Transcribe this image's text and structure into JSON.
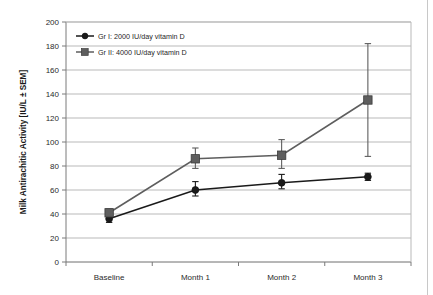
{
  "chart_data": {
    "type": "line",
    "title": "",
    "xlabel": "",
    "ylabel": "Milk Antirachitic Activity [IU/L ± SEM]",
    "categories": [
      "Baseline",
      "Month 1",
      "Month 2",
      "Month 3"
    ],
    "ylim": [
      0,
      200
    ],
    "ytick_step": 20,
    "yticks": [
      200,
      180,
      160,
      140,
      120,
      100,
      80,
      60,
      40,
      20,
      0
    ],
    "ytick_labels": [
      "200",
      "180",
      "160",
      "140",
      "120",
      "100",
      "80",
      "60",
      "40",
      "20",
      "0"
    ],
    "grid": "horizontal",
    "legend_position": "top-left-inside",
    "series": [
      {
        "name": "Gr I: 2000 IU/day vitamin D",
        "marker": "circle",
        "color": "#1a1a1a",
        "values": [
          36,
          60,
          66,
          71
        ],
        "error_low": [
          33,
          55,
          61,
          68
        ],
        "error_high": [
          39,
          67,
          73,
          74
        ]
      },
      {
        "name": "Gr II: 4000 IU/day vitamin D",
        "marker": "square",
        "color": "#5e5e5e",
        "values": [
          41,
          86,
          89,
          135
        ],
        "error_low": [
          38,
          78,
          78,
          88
        ],
        "error_high": [
          44,
          95,
          102,
          182
        ]
      }
    ]
  },
  "legend": {
    "items": [
      {
        "label": "Gr I: 2000 IU/day vitamin D",
        "marker": "circle",
        "color": "#1a1a1a"
      },
      {
        "label": "Gr II: 4000 IU/day vitamin D",
        "marker": "square",
        "color": "#5e5e5e"
      }
    ]
  },
  "axes": {
    "y_title": "Milk Antirachitic Activity [IU/L ± SEM]",
    "y_labels": [
      "200",
      "180",
      "160",
      "140",
      "120",
      "100",
      "80",
      "60",
      "40",
      "20",
      "0"
    ],
    "x_labels": [
      "Baseline",
      "Month 1",
      "Month 2",
      "Month 3"
    ]
  },
  "colors": {
    "series1": "#1a1a1a",
    "series2": "#5e5e5e",
    "grid": "#b9b9b9",
    "frame": "#7a7a7a",
    "background": "#ffffff",
    "page_edge": "#c8c8c8"
  }
}
